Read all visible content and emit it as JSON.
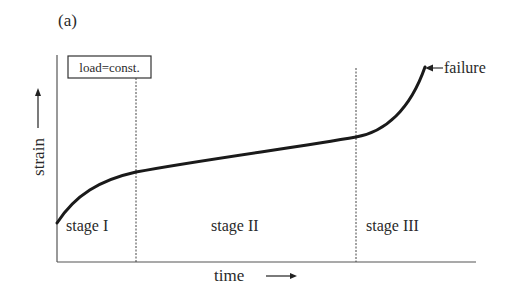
{
  "figure": {
    "panel_label": "(a)",
    "condition_box": "load=const.",
    "x_axis_label": "time",
    "y_axis_label": "strain",
    "annotation": "failure",
    "stages": [
      {
        "label": "stage I"
      },
      {
        "label": "stage II"
      },
      {
        "label": "stage III"
      }
    ]
  },
  "colors": {
    "curve": "#1a1a1a",
    "axis": "#555555",
    "dashed": "#444444",
    "text": "#2a2a2a"
  }
}
